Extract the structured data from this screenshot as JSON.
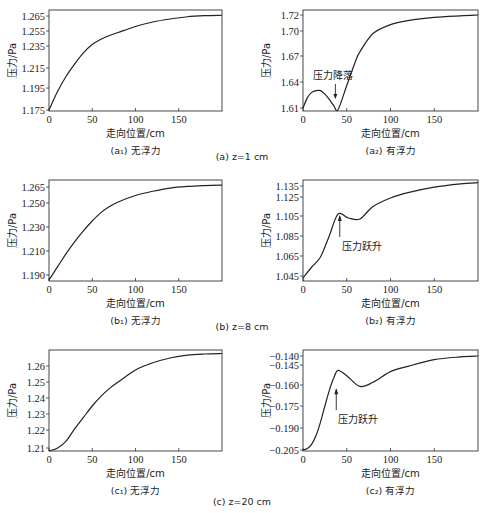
{
  "figure": {
    "group_captions": [
      {
        "id": "a",
        "text": "(a) z=1 cm"
      },
      {
        "id": "b",
        "text": "(b) z=8 cm"
      },
      {
        "id": "c",
        "text": "(c) z=20 cm"
      }
    ]
  },
  "chart_data": [
    {
      "id": "a1",
      "type": "line",
      "title": "(a₁) 无浮力",
      "group": "(a) z=1 cm",
      "xlabel": "走向位置/cm",
      "ylabel": "压力/Pa",
      "xlim": [
        0,
        200
      ],
      "xticks": [
        0,
        50,
        100,
        150
      ],
      "yticks": [
        "1.175",
        "1.195",
        "1.215",
        "1.235",
        "1.255",
        "1.265"
      ],
      "grid": false,
      "box": {
        "left": 49,
        "right": 222,
        "top": 10,
        "bottom": 111
      },
      "ytick_px": [
        110,
        88,
        68,
        46,
        31,
        16
      ],
      "x": [
        0,
        10,
        20,
        30,
        40,
        50,
        60,
        70,
        80,
        100,
        120,
        140,
        160,
        180,
        200
      ],
      "y": [
        1.175,
        1.192,
        1.207,
        1.219,
        1.229,
        1.237,
        1.244,
        1.249,
        1.253,
        1.258,
        1.261,
        1.263,
        1.2645,
        1.2652,
        1.2655
      ],
      "annotations": []
    },
    {
      "id": "a2",
      "type": "line",
      "title": "(a₂) 有浮力",
      "group": "(a) z=1 cm",
      "xlabel": "走向位置/cm",
      "ylabel": "压力/Pa",
      "xlim": [
        0,
        200
      ],
      "xticks": [
        0,
        50,
        100,
        150
      ],
      "yticks": [
        "1.61",
        "1.64",
        "1.67",
        "1.70",
        "1.72"
      ],
      "grid": false,
      "box": {
        "left": 303,
        "right": 478,
        "top": 10,
        "bottom": 111
      },
      "ytick_px": [
        108,
        82,
        56,
        31,
        15
      ],
      "x": [
        0,
        5,
        10,
        15,
        20,
        25,
        30,
        35,
        40,
        50,
        60,
        65,
        80,
        100,
        120,
        150,
        180,
        200
      ],
      "y": [
        1.61,
        1.622,
        1.628,
        1.63,
        1.63,
        1.626,
        1.62,
        1.613,
        1.608,
        1.636,
        1.664,
        1.675,
        1.697,
        1.708,
        1.713,
        1.717,
        1.719,
        1.72
      ],
      "annotations": [
        {
          "text": "压力降落",
          "x": 37,
          "y": 1.625,
          "arrow": "down"
        }
      ]
    },
    {
      "id": "b1",
      "type": "line",
      "title": "(b₁) 无浮力",
      "group": "(b) z=8 cm",
      "xlabel": "走向位置/cm",
      "ylabel": "压力/Pa",
      "xlim": [
        0,
        200
      ],
      "xticks": [
        0,
        50,
        100,
        150
      ],
      "yticks": [
        "1.190",
        "1.210",
        "1.230",
        "1.250",
        "1.265"
      ],
      "grid": false,
      "box": {
        "left": 49,
        "right": 222,
        "top": 180,
        "bottom": 281
      },
      "ytick_px": [
        275,
        251,
        227,
        203,
        187
      ],
      "x": [
        0,
        10,
        20,
        30,
        40,
        50,
        60,
        70,
        80,
        100,
        120,
        140,
        160,
        180,
        200
      ],
      "y": [
        1.186,
        1.197,
        1.208,
        1.218,
        1.227,
        1.235,
        1.242,
        1.247,
        1.251,
        1.257,
        1.261,
        1.264,
        1.2655,
        1.2663,
        1.2668
      ],
      "annotations": []
    },
    {
      "id": "b2",
      "type": "line",
      "title": "(b₂) 有浮力",
      "group": "(b) z=8 cm",
      "xlabel": "走向位置/cm",
      "ylabel": "压力/Pa",
      "xlim": [
        0,
        200
      ],
      "xticks": [
        0,
        50,
        100,
        150
      ],
      "yticks": [
        "1.045",
        "1.065",
        "1.085",
        "1.105",
        "1.125",
        "1.135"
      ],
      "grid": false,
      "box": {
        "left": 303,
        "right": 478,
        "top": 180,
        "bottom": 281
      },
      "ytick_px": [
        276,
        256,
        236,
        216,
        197,
        186
      ],
      "x": [
        0,
        10,
        20,
        30,
        40,
        52,
        65,
        80,
        100,
        120,
        150,
        180,
        200
      ],
      "y": [
        1.043,
        1.054,
        1.064,
        1.085,
        1.107,
        1.103,
        1.102,
        1.115,
        1.124,
        1.129,
        1.134,
        1.137,
        1.138
      ],
      "annotations": [
        {
          "text": "压力跃升",
          "x": 42,
          "y": 1.098,
          "arrow": "up"
        }
      ]
    },
    {
      "id": "c1",
      "type": "line",
      "title": "(c₁) 无浮力",
      "group": "(c) z=20 cm",
      "xlabel": "走向位置/cm",
      "ylabel": "压力/Pa",
      "xlim": [
        0,
        200
      ],
      "xticks": [
        0,
        50,
        100,
        150
      ],
      "yticks": [
        "1.21",
        "1.22",
        "1.23",
        "1.24",
        "1.25",
        "1.26"
      ],
      "grid": false,
      "box": {
        "left": 49,
        "right": 222,
        "top": 350,
        "bottom": 451
      },
      "ytick_px": [
        448,
        430,
        414,
        398,
        382,
        366
      ],
      "x": [
        0,
        10,
        20,
        30,
        40,
        50,
        60,
        70,
        80,
        100,
        120,
        140,
        160,
        180,
        200
      ],
      "y": [
        1.208,
        1.21,
        1.214,
        1.221,
        1.228,
        1.235,
        1.241,
        1.246,
        1.25,
        1.2575,
        1.262,
        1.265,
        1.2668,
        1.2675,
        1.2678
      ],
      "annotations": []
    },
    {
      "id": "c2",
      "type": "line",
      "title": "(c₂) 有浮力",
      "group": "(c) z=20 cm",
      "xlabel": "走向位置/cm",
      "ylabel": "压力/Pa",
      "xlim": [
        0,
        200
      ],
      "xticks": [
        0,
        50,
        100,
        150
      ],
      "yticks": [
        "-0.205",
        "-0.190",
        "-0.175",
        "-0.160",
        "-0.145",
        "-0.140"
      ],
      "grid": false,
      "box": {
        "left": 303,
        "right": 478,
        "top": 350,
        "bottom": 451
      },
      "ytick_px": [
        450,
        428,
        406,
        385,
        365,
        356
      ],
      "x": [
        0,
        5,
        10,
        15,
        20,
        25,
        30,
        35,
        40,
        50,
        65,
        80,
        100,
        120,
        150,
        180,
        200
      ],
      "y": [
        -0.205,
        -0.204,
        -0.201,
        -0.195,
        -0.186,
        -0.175,
        -0.164,
        -0.155,
        -0.149,
        -0.153,
        -0.161,
        -0.158,
        -0.15,
        -0.146,
        -0.142,
        -0.1405,
        -0.14
      ],
      "annotations": [
        {
          "text": "压力跃升",
          "x": 38,
          "y": -0.168,
          "arrow": "up"
        }
      ]
    }
  ]
}
